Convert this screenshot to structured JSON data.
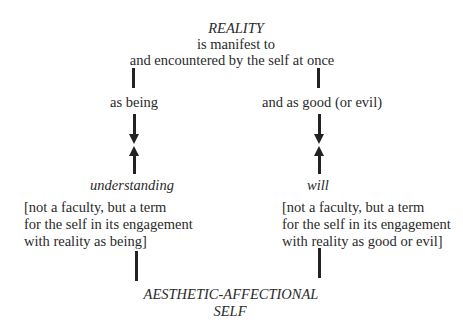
{
  "top": {
    "title": "REALITY",
    "line1": "is manifest to",
    "line2": "and encountered by the self at once"
  },
  "left": {
    "mode": "as being",
    "term": "understanding",
    "note": [
      "[not a faculty, but a term",
      "for the self in its engagement",
      "with reality as being]"
    ]
  },
  "right": {
    "mode": "and as good (or evil)",
    "term": "will",
    "note": [
      "[not a faculty, but a term",
      "for the self in its engagement",
      "with reality as good or evil]"
    ]
  },
  "bottom": {
    "line1": "AESTHETIC-AFFECTIONAL",
    "line2": "SELF"
  },
  "colors": {
    "ink": "#222222",
    "background": "#ffffff"
  }
}
